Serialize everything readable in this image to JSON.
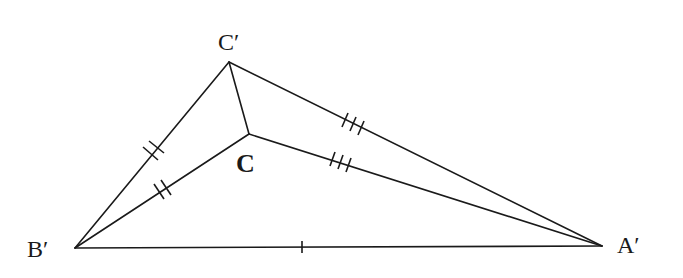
{
  "diagram": {
    "type": "geometric-figure",
    "labels": {
      "c_prime": "C′",
      "c": "C",
      "b_prime": "B′",
      "a_prime": "A′"
    },
    "points": {
      "C_prime": [
        229,
        62
      ],
      "C": [
        249,
        134
      ],
      "B_prime": [
        75,
        248
      ],
      "A_prime": [
        602,
        246
      ]
    },
    "segments": [
      {
        "from": "B_prime",
        "to": "C_prime",
        "ticks": 2
      },
      {
        "from": "B_prime",
        "to": "C",
        "ticks": 2
      },
      {
        "from": "C_prime",
        "to": "A_prime",
        "ticks": 3
      },
      {
        "from": "C",
        "to": "A_prime",
        "ticks": 3
      },
      {
        "from": "B_prime",
        "to": "A_prime",
        "ticks": 1
      },
      {
        "from": "C_prime",
        "to": "C",
        "ticks": 0
      }
    ],
    "colors": {
      "stroke": "#1a1a1a",
      "background": "#ffffff"
    }
  }
}
